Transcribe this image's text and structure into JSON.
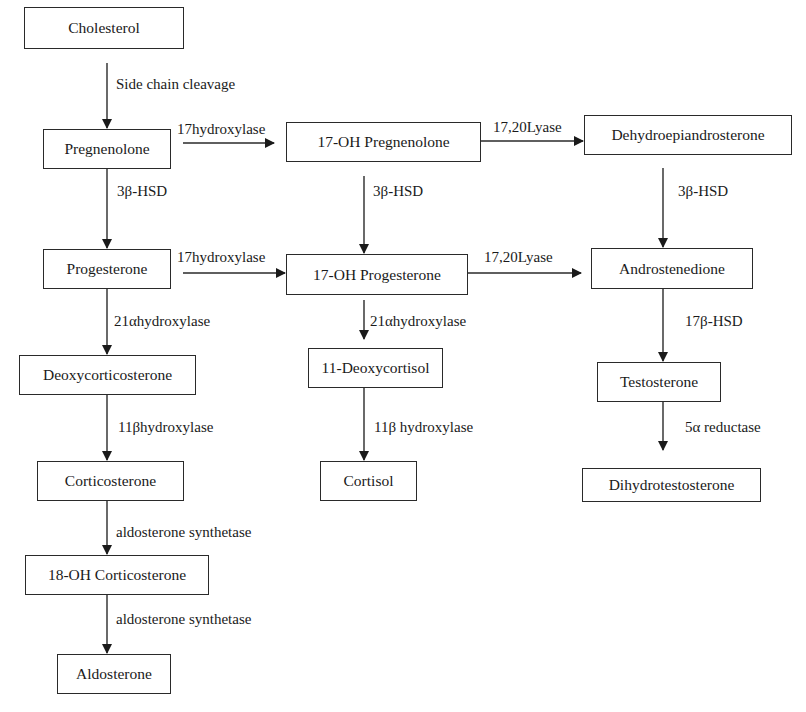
{
  "diagram": {
    "type": "steroidogenesis-pathway",
    "nodes": {
      "cholesterol": "Cholesterol",
      "pregnenolone": "Pregnenolone",
      "oh17_pregnenolone": "17-OH Pregnenolone",
      "dhea": "Dehydroepiandrosterone",
      "progesterone": "Progesterone",
      "oh17_progesterone": "17-OH Progesterone",
      "androstenedione": "Androstenedione",
      "deoxycorticosterone": "Deoxycorticosterone",
      "deoxycortisol_11": "11-Deoxycortisol",
      "testosterone": "Testosterone",
      "corticosterone": "Corticosterone",
      "cortisol": "Cortisol",
      "dht": "Dihydrotestosterone",
      "oh18_corticosterone": "18-OH Corticosterone",
      "aldosterone": "Aldosterone"
    },
    "edges": {
      "side_chain_cleavage": "Side chain cleavage",
      "hydroxylase17_a": "17hydroxylase",
      "hydroxylase17_b": "17hydroxylase",
      "lyase_a": "17,20Lyase",
      "lyase_b": "17,20Lyase",
      "hsd3b_a": "3β-HSD",
      "hsd3b_b": "3β-HSD",
      "hsd3b_c": "3β-HSD",
      "hydroxylase21a_a": "21αhydroxylase",
      "hydroxylase21a_b": "21αhydroxylase",
      "hsd17b": "17β-HSD",
      "hydroxylase11b_a": "11βhydroxylase",
      "hydroxylase11b_b": "11β hydroxylase",
      "reductase5a": "5α reductase",
      "aldo_synthetase_a": "aldosterone synthetase",
      "aldo_synthetase_b": "aldosterone synthetase"
    },
    "colors": {
      "line": "#2a2a2a",
      "background": "#ffffff",
      "text": "#1a1a1a"
    }
  }
}
